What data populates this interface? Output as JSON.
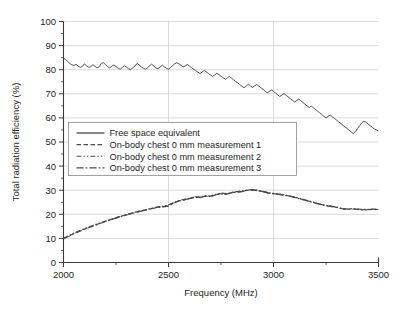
{
  "chart_data": {
    "type": "line",
    "title": "",
    "xlabel": "Frequency (MHz)",
    "ylabel": "Total radiation efficiency (%)",
    "xlim": [
      2000,
      3500
    ],
    "ylim": [
      0,
      100
    ],
    "xticks": [
      2000,
      2500,
      3000,
      3500
    ],
    "xtick_labels": [
      "2000",
      "2500",
      "3000",
      "3500"
    ],
    "xminor_ticks": [
      2250,
      2750,
      3250
    ],
    "yticks": [
      0,
      10,
      20,
      30,
      40,
      50,
      60,
      70,
      80,
      90,
      100
    ],
    "ytick_labels": [
      "0",
      "10",
      "20",
      "30",
      "40",
      "50",
      "60",
      "70",
      "80",
      "90",
      "100"
    ],
    "yminor_ticks": [
      5,
      15,
      25,
      35,
      45,
      55,
      65,
      75,
      85,
      95
    ],
    "grid": true,
    "grid_color": "#cccccc",
    "legend_position": "center-left",
    "line_color": "#4a4a4a",
    "series": [
      {
        "name": "Free space equivalent",
        "dash": "solid",
        "x": [
          2000,
          2010,
          2020,
          2030,
          2040,
          2050,
          2060,
          2070,
          2080,
          2090,
          2100,
          2110,
          2120,
          2130,
          2140,
          2150,
          2160,
          2170,
          2180,
          2190,
          2200,
          2210,
          2220,
          2230,
          2240,
          2250,
          2260,
          2270,
          2280,
          2290,
          2300,
          2310,
          2320,
          2330,
          2340,
          2350,
          2360,
          2370,
          2380,
          2390,
          2400,
          2410,
          2420,
          2430,
          2440,
          2450,
          2460,
          2470,
          2480,
          2490,
          2500,
          2510,
          2520,
          2530,
          2540,
          2550,
          2560,
          2570,
          2580,
          2590,
          2600,
          2610,
          2620,
          2630,
          2640,
          2650,
          2660,
          2670,
          2680,
          2690,
          2700,
          2710,
          2720,
          2730,
          2740,
          2750,
          2760,
          2770,
          2780,
          2790,
          2800,
          2810,
          2820,
          2830,
          2840,
          2850,
          2860,
          2870,
          2880,
          2890,
          2900,
          2910,
          2920,
          2930,
          2940,
          2950,
          2960,
          2970,
          2980,
          2990,
          3000,
          3010,
          3020,
          3030,
          3040,
          3050,
          3060,
          3070,
          3080,
          3090,
          3100,
          3110,
          3120,
          3130,
          3140,
          3150,
          3160,
          3170,
          3180,
          3190,
          3200,
          3210,
          3220,
          3230,
          3240,
          3250,
          3260,
          3270,
          3280,
          3290,
          3300,
          3310,
          3320,
          3330,
          3340,
          3350,
          3360,
          3370,
          3380,
          3390,
          3400,
          3410,
          3420,
          3430,
          3440,
          3450,
          3460,
          3470,
          3480,
          3490,
          3500
        ],
        "y": [
          84.8,
          84.3,
          83.4,
          82.6,
          82.0,
          81.8,
          82.2,
          81.5,
          81.0,
          81.4,
          82.4,
          81.6,
          80.9,
          81.3,
          82.1,
          81.4,
          80.8,
          81.2,
          82.6,
          82.9,
          82.1,
          81.3,
          80.7,
          81.4,
          82.0,
          81.3,
          80.6,
          80.2,
          80.9,
          81.7,
          81.0,
          80.4,
          80.0,
          80.8,
          81.5,
          82.6,
          82.0,
          81.2,
          80.6,
          80.2,
          80.8,
          81.6,
          82.3,
          81.5,
          80.8,
          80.4,
          81.1,
          81.9,
          81.2,
          80.6,
          80.2,
          80.9,
          81.7,
          82.5,
          82.9,
          82.4,
          81.8,
          81.2,
          81.6,
          82.2,
          81.5,
          80.8,
          80.2,
          79.6,
          79.0,
          78.4,
          79.0,
          79.7,
          79.1,
          78.4,
          77.8,
          77.2,
          77.8,
          78.5,
          78.0,
          77.3,
          76.7,
          76.0,
          76.6,
          77.2,
          76.5,
          75.8,
          75.1,
          74.5,
          73.8,
          73.1,
          72.5,
          73.2,
          74.0,
          73.3,
          72.6,
          73.3,
          73.9,
          73.2,
          72.5,
          71.8,
          71.1,
          70.4,
          71.0,
          71.6,
          71.0,
          70.3,
          69.6,
          68.9,
          69.5,
          70.1,
          69.4,
          68.7,
          68.0,
          67.3,
          66.6,
          67.2,
          67.8,
          67.1,
          66.4,
          65.7,
          65.0,
          64.3,
          64.9,
          64.2,
          63.5,
          62.8,
          62.1,
          61.4,
          60.7,
          60.0,
          60.6,
          61.2,
          60.5,
          59.8,
          59.1,
          58.4,
          57.7,
          57.0,
          56.3,
          55.6,
          54.9,
          54.2,
          53.5,
          54.3,
          55.6,
          56.8,
          57.9,
          58.6,
          58.2,
          57.5,
          56.8,
          56.1,
          55.4,
          55.0,
          54.6
        ]
      },
      {
        "name": "On-body chest 0 mm measurement 1",
        "dash": "dashed",
        "x": [
          2000,
          2025,
          2050,
          2075,
          2100,
          2125,
          2150,
          2175,
          2200,
          2225,
          2250,
          2275,
          2300,
          2325,
          2350,
          2375,
          2400,
          2425,
          2450,
          2475,
          2500,
          2525,
          2550,
          2575,
          2600,
          2625,
          2650,
          2675,
          2700,
          2725,
          2750,
          2775,
          2800,
          2825,
          2850,
          2875,
          2900,
          2925,
          2950,
          2975,
          3000,
          3025,
          3050,
          3075,
          3100,
          3125,
          3150,
          3175,
          3200,
          3225,
          3250,
          3275,
          3300,
          3325,
          3350,
          3375,
          3400,
          3425,
          3450,
          3475,
          3500
        ],
        "y": [
          10.0,
          11.0,
          12.1,
          13.0,
          13.9,
          14.7,
          15.5,
          16.3,
          17.1,
          17.8,
          18.5,
          19.2,
          19.8,
          20.4,
          21.0,
          21.5,
          22.0,
          22.5,
          23.0,
          23.2,
          23.6,
          24.8,
          25.6,
          26.0,
          26.6,
          27.1,
          27.0,
          27.6,
          27.4,
          28.2,
          28.6,
          28.4,
          29.0,
          29.3,
          29.5,
          30.0,
          30.2,
          29.9,
          29.4,
          28.9,
          28.6,
          28.3,
          28.0,
          27.6,
          27.1,
          26.5,
          25.9,
          25.3,
          24.7,
          24.1,
          23.6,
          23.3,
          22.9,
          22.4,
          22.1,
          22.3,
          22.1,
          21.9,
          22.0,
          22.1,
          22.0
        ]
      },
      {
        "name": "On-body chest 0 mm measurement 2",
        "dash": "dashdotdot",
        "x": [
          2000,
          2025,
          2050,
          2075,
          2100,
          2125,
          2150,
          2175,
          2200,
          2225,
          2250,
          2275,
          2300,
          2325,
          2350,
          2375,
          2400,
          2425,
          2450,
          2475,
          2500,
          2525,
          2550,
          2575,
          2600,
          2625,
          2650,
          2675,
          2700,
          2725,
          2750,
          2775,
          2800,
          2825,
          2850,
          2875,
          2900,
          2925,
          2950,
          2975,
          3000,
          3025,
          3050,
          3075,
          3100,
          3125,
          3150,
          3175,
          3200,
          3225,
          3250,
          3275,
          3300,
          3325,
          3350,
          3375,
          3400,
          3425,
          3450,
          3475,
          3500
        ],
        "y": [
          10.1,
          11.2,
          12.2,
          13.2,
          14.0,
          14.9,
          15.7,
          16.4,
          17.2,
          17.9,
          18.6,
          19.3,
          19.9,
          20.5,
          21.1,
          21.6,
          22.1,
          22.6,
          23.1,
          23.4,
          23.9,
          25.0,
          25.7,
          26.2,
          26.7,
          27.3,
          27.2,
          27.8,
          27.6,
          28.3,
          28.8,
          28.6,
          29.1,
          29.4,
          29.7,
          30.1,
          30.3,
          30.0,
          29.5,
          29.0,
          28.7,
          28.4,
          28.1,
          27.7,
          27.2,
          26.6,
          26.0,
          25.4,
          24.8,
          24.2,
          23.7,
          23.4,
          23.0,
          22.5,
          22.2,
          22.4,
          22.2,
          22.0,
          22.1,
          22.2,
          22.1
        ]
      },
      {
        "name": "On-body chest 0 mm measurement 3",
        "dash": "dashdot",
        "x": [
          2000,
          2025,
          2050,
          2075,
          2100,
          2125,
          2150,
          2175,
          2200,
          2225,
          2250,
          2275,
          2300,
          2325,
          2350,
          2375,
          2400,
          2425,
          2450,
          2475,
          2500,
          2525,
          2550,
          2575,
          2600,
          2625,
          2650,
          2675,
          2700,
          2725,
          2750,
          2775,
          2800,
          2825,
          2850,
          2875,
          2900,
          2925,
          2950,
          2975,
          3000,
          3025,
          3050,
          3075,
          3100,
          3125,
          3150,
          3175,
          3200,
          3225,
          3250,
          3275,
          3300,
          3325,
          3350,
          3375,
          3400,
          3425,
          3450,
          3475,
          3500
        ],
        "y": [
          9.9,
          10.9,
          12.0,
          12.9,
          13.8,
          14.6,
          15.4,
          16.2,
          17.0,
          17.7,
          18.4,
          19.1,
          19.7,
          20.3,
          20.9,
          21.4,
          21.9,
          22.4,
          22.9,
          23.1,
          23.4,
          24.6,
          25.5,
          25.9,
          26.5,
          27.0,
          26.9,
          27.5,
          27.3,
          28.1,
          28.5,
          28.3,
          28.9,
          29.2,
          29.4,
          29.9,
          30.1,
          29.8,
          29.3,
          28.8,
          28.5,
          28.2,
          27.9,
          27.5,
          27.0,
          26.4,
          25.8,
          25.2,
          24.6,
          24.0,
          23.5,
          23.2,
          22.8,
          22.3,
          22.0,
          22.2,
          22.0,
          21.8,
          21.9,
          22.0,
          21.9
        ]
      }
    ]
  },
  "legend": {
    "items": [
      {
        "label": "Free space equivalent",
        "dash": "solid"
      },
      {
        "label": "On-body chest 0 mm measurement 1",
        "dash": "dashed"
      },
      {
        "label": "On-body chest 0 mm measurement 2",
        "dash": "dashdotdot"
      },
      {
        "label": "On-body chest 0 mm measurement 3",
        "dash": "dashdot"
      }
    ]
  }
}
